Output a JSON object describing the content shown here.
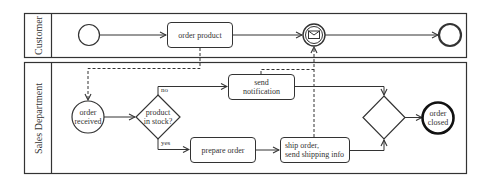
{
  "diagram": {
    "type": "BPMN process",
    "pools": [
      {
        "id": "customer",
        "label": "Customer"
      },
      {
        "id": "sales",
        "label": "Sales Department"
      }
    ],
    "nodes": {
      "customer_start": {
        "type": "start-event",
        "label": ""
      },
      "order_product": {
        "type": "task",
        "label": "order product"
      },
      "message_event": {
        "type": "intermediate-message-catch-event",
        "label": ""
      },
      "customer_end": {
        "type": "end-event",
        "label": ""
      },
      "order_received": {
        "type": "start-event",
        "label": "order received"
      },
      "stock_gateway": {
        "type": "exclusive-gateway",
        "label": "product in stock?",
        "line1": "product",
        "line2": "in stock?"
      },
      "send_notification": {
        "type": "task",
        "label": "send notification",
        "line1": "send",
        "line2": "notification"
      },
      "prepare_order": {
        "type": "task",
        "label": "prepare order"
      },
      "ship_order": {
        "type": "task",
        "label": "ship order, send shipping info",
        "line1": "ship order,",
        "line2": "send shipping info"
      },
      "merge_gateway": {
        "type": "exclusive-gateway",
        "label": ""
      },
      "order_closed": {
        "type": "end-event",
        "label": "order closed",
        "line1": "order",
        "line2": "closed"
      }
    },
    "edge_labels": {
      "no": "no",
      "yes": "yes"
    },
    "colors": {
      "stroke": "#333333",
      "background": "#ffffff",
      "text": "#333333"
    }
  }
}
